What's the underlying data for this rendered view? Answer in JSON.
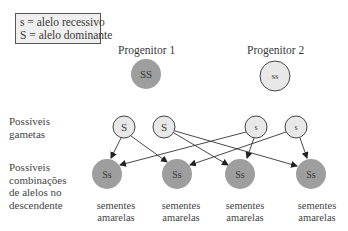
{
  "legend": {
    "line1": "s = alelo recessivo",
    "line2": "S = alelo dominante"
  },
  "parents": [
    {
      "label": "Progenitor 1",
      "genotype": "SS",
      "fill": "#9e9e9e"
    },
    {
      "label": "Progenitor 2",
      "genotype": "ss",
      "fill": "#e8e8e8"
    }
  ],
  "row_labels": {
    "gametes": [
      "Possíveis",
      "gametas"
    ],
    "offspring": [
      "Possíveis",
      "combinações",
      "de alelos no",
      "descendente"
    ]
  },
  "gametes": [
    {
      "allele": "S"
    },
    {
      "allele": "S"
    },
    {
      "allele": "s"
    },
    {
      "allele": "s"
    }
  ],
  "offspring": [
    {
      "genotype": "Ss",
      "phenotype_line1": "sementes",
      "phenotype_line2": "amarelas"
    },
    {
      "genotype": "Ss",
      "phenotype_line1": "sementes",
      "phenotype_line2": "amarelas"
    },
    {
      "genotype": "Ss",
      "phenotype_line1": "sementes",
      "phenotype_line2": "amarelas"
    },
    {
      "genotype": "Ss",
      "phenotype_line1": "sementes",
      "phenotype_line2": "amarelas"
    }
  ],
  "colors": {
    "dominant_fill": "#9e9e9e",
    "recessive_fill": "#e8e8e8",
    "offspring_fill": "#9e9e9e",
    "stroke": "#444444"
  }
}
